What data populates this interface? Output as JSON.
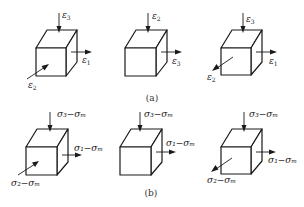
{
  "figure": {
    "panels": [
      {
        "id": "a",
        "caption": "(a)",
        "cubes": [
          {
            "labels": {
              "top": "ε3",
              "right": "ε1",
              "front": "ε2"
            },
            "front_arrow_direction": "inward"
          },
          {
            "labels": {
              "top": "ε2",
              "right": "ε3"
            },
            "front_arrow_direction": "none"
          },
          {
            "labels": {
              "top": "ε3",
              "right": "ε1",
              "front": "ε2"
            },
            "front_arrow_direction": "outward"
          }
        ]
      },
      {
        "id": "b",
        "caption": "(b)",
        "cubes": [
          {
            "labels": {
              "top": "σ3−σm",
              "right": "σ1−σm",
              "front": "σ2−σm"
            },
            "front_arrow_direction": "inward"
          },
          {
            "labels": {
              "top": "σ3−σm",
              "right": "σ1−σm"
            },
            "front_arrow_direction": "none"
          },
          {
            "labels": {
              "top": "σ3−σm",
              "right": "σ1−σm",
              "front": "σ2−σm"
            },
            "front_arrow_direction": "outward"
          }
        ]
      }
    ]
  },
  "text": {
    "a": {
      "c1_top_main": "ε",
      "c1_top_sub": "3",
      "c1_right_main": "ε",
      "c1_right_sub": "1",
      "c1_front_main": "ε",
      "c1_front_sub": "2",
      "c2_top_main": "ε",
      "c2_top_sub": "2",
      "c2_right_main": "ε",
      "c2_right_sub": "3",
      "c3_top_main": "ε",
      "c3_top_sub": "3",
      "c3_right_main": "ε",
      "c3_right_sub": "1",
      "c3_front_main": "ε",
      "c3_front_sub": "2",
      "caption": "(a)"
    },
    "b": {
      "top": "σ₃−σₘ",
      "right": "σ₁−σₘ",
      "front": "σ₂−σₘ",
      "caption": "(b)"
    }
  }
}
